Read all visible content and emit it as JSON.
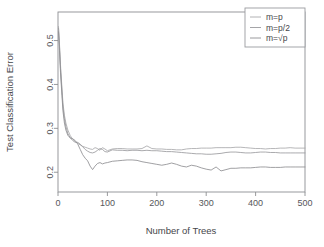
{
  "chart_data": {
    "type": "line",
    "title": "",
    "xlabel": "Number of Trees",
    "ylabel": "Test Classification Error",
    "xlim": [
      0,
      500
    ],
    "ylim": [
      0.155,
      0.565
    ],
    "xticks": [
      0,
      100,
      200,
      300,
      400,
      500
    ],
    "xtick_labels": [
      "0",
      "100",
      "200",
      "300",
      "400",
      "500"
    ],
    "yticks": [
      0.2,
      0.3,
      0.4,
      0.5
    ],
    "ytick_labels": [
      "0.2",
      "0.3",
      "0.4",
      "0.5"
    ],
    "grid": false,
    "legend_position": "top-right",
    "legend_entries": [
      "m=p",
      "m=p/2",
      "m=√p"
    ],
    "series": [
      {
        "name": "m=p",
        "color": "#a9a9ab",
        "x": [
          1,
          3,
          5,
          8,
          10,
          13,
          16,
          20,
          25,
          30,
          35,
          40,
          45,
          50,
          55,
          60,
          65,
          70,
          75,
          80,
          85,
          90,
          95,
          100,
          110,
          120,
          130,
          140,
          150,
          160,
          170,
          180,
          190,
          200,
          210,
          220,
          230,
          240,
          250,
          260,
          270,
          280,
          290,
          300,
          310,
          320,
          330,
          340,
          350,
          360,
          370,
          380,
          390,
          400,
          410,
          420,
          430,
          440,
          450,
          460,
          470,
          480,
          490,
          500
        ],
        "y": [
          0.532,
          0.492,
          0.445,
          0.392,
          0.358,
          0.33,
          0.312,
          0.296,
          0.283,
          0.275,
          0.27,
          0.266,
          0.262,
          0.259,
          0.257,
          0.255,
          0.253,
          0.252,
          0.256,
          0.254,
          0.25,
          0.256,
          0.253,
          0.249,
          0.253,
          0.254,
          0.254,
          0.253,
          0.253,
          0.253,
          0.254,
          0.26,
          0.254,
          0.253,
          0.253,
          0.252,
          0.252,
          0.251,
          0.251,
          0.253,
          0.254,
          0.254,
          0.255,
          0.255,
          0.255,
          0.256,
          0.256,
          0.256,
          0.256,
          0.257,
          0.257,
          0.256,
          0.255,
          0.254,
          0.254,
          0.253,
          0.254,
          0.254,
          0.255,
          0.255,
          0.256,
          0.255,
          0.255,
          0.255
        ]
      },
      {
        "name": "m=p/2",
        "color": "#9b9b9e",
        "x": [
          1,
          3,
          5,
          8,
          10,
          13,
          16,
          20,
          25,
          30,
          35,
          40,
          45,
          50,
          55,
          60,
          65,
          70,
          75,
          80,
          85,
          90,
          95,
          100,
          110,
          120,
          130,
          140,
          150,
          160,
          170,
          180,
          190,
          200,
          210,
          220,
          230,
          240,
          250,
          260,
          270,
          280,
          290,
          300,
          310,
          320,
          330,
          340,
          350,
          360,
          370,
          380,
          390,
          400,
          410,
          420,
          430,
          440,
          450,
          460,
          470,
          480,
          490,
          500
        ],
        "y": [
          0.528,
          0.487,
          0.437,
          0.384,
          0.349,
          0.322,
          0.304,
          0.288,
          0.278,
          0.272,
          0.268,
          0.268,
          0.264,
          0.258,
          0.252,
          0.248,
          0.245,
          0.244,
          0.246,
          0.25,
          0.254,
          0.252,
          0.247,
          0.246,
          0.251,
          0.25,
          0.25,
          0.249,
          0.25,
          0.25,
          0.249,
          0.25,
          0.249,
          0.249,
          0.248,
          0.247,
          0.247,
          0.246,
          0.245,
          0.244,
          0.243,
          0.242,
          0.242,
          0.241,
          0.241,
          0.242,
          0.243,
          0.245,
          0.246,
          0.246,
          0.245,
          0.244,
          0.244,
          0.245,
          0.246,
          0.246,
          0.245,
          0.245,
          0.244,
          0.244,
          0.244,
          0.244,
          0.244,
          0.244
        ]
      },
      {
        "name": "m=√p",
        "color": "#8f8f92",
        "x": [
          1,
          3,
          5,
          8,
          10,
          13,
          16,
          20,
          25,
          30,
          35,
          40,
          45,
          50,
          55,
          60,
          65,
          70,
          75,
          80,
          85,
          90,
          95,
          100,
          110,
          120,
          130,
          140,
          150,
          160,
          170,
          180,
          190,
          200,
          210,
          220,
          230,
          240,
          250,
          260,
          270,
          280,
          290,
          300,
          310,
          320,
          330,
          340,
          350,
          360,
          370,
          380,
          390,
          400,
          410,
          420,
          430,
          440,
          450,
          460,
          470,
          480,
          490,
          500
        ],
        "y": [
          0.52,
          0.478,
          0.428,
          0.375,
          0.34,
          0.312,
          0.296,
          0.284,
          0.278,
          0.276,
          0.272,
          0.264,
          0.252,
          0.24,
          0.232,
          0.226,
          0.214,
          0.206,
          0.214,
          0.22,
          0.222,
          0.219,
          0.221,
          0.222,
          0.225,
          0.226,
          0.227,
          0.228,
          0.228,
          0.227,
          0.224,
          0.222,
          0.22,
          0.218,
          0.216,
          0.218,
          0.221,
          0.218,
          0.214,
          0.212,
          0.216,
          0.214,
          0.21,
          0.207,
          0.205,
          0.212,
          0.203,
          0.206,
          0.209,
          0.209,
          0.21,
          0.21,
          0.21,
          0.211,
          0.212,
          0.212,
          0.211,
          0.211,
          0.211,
          0.212,
          0.212,
          0.212,
          0.212,
          0.212
        ]
      }
    ]
  }
}
